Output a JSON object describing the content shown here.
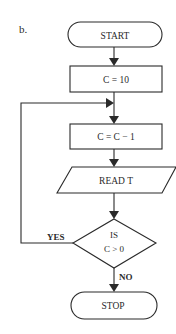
{
  "figure": {
    "label": "b."
  },
  "colors": {
    "ink": "#2a2a2a",
    "background": "#ffffff"
  },
  "flowchart": {
    "nodes": [
      {
        "id": "start",
        "type": "terminal",
        "text": "START"
      },
      {
        "id": "init",
        "type": "process",
        "text": "C = 10"
      },
      {
        "id": "decrement",
        "type": "process",
        "text": "C = C − 1"
      },
      {
        "id": "read",
        "type": "input-output",
        "text": "READ T"
      },
      {
        "id": "decision",
        "type": "decision",
        "line1": "IS",
        "line2": "C > 0"
      },
      {
        "id": "stop",
        "type": "terminal",
        "text": "STOP"
      }
    ],
    "edges": [
      {
        "from": "start",
        "to": "init"
      },
      {
        "from": "init",
        "to": "decrement"
      },
      {
        "from": "decrement",
        "to": "read"
      },
      {
        "from": "read",
        "to": "decision"
      },
      {
        "from": "decision",
        "to": "decrement",
        "label": "YES"
      },
      {
        "from": "decision",
        "to": "stop",
        "label": "NO"
      }
    ],
    "labels": {
      "yes": "YES",
      "no": "NO"
    }
  }
}
